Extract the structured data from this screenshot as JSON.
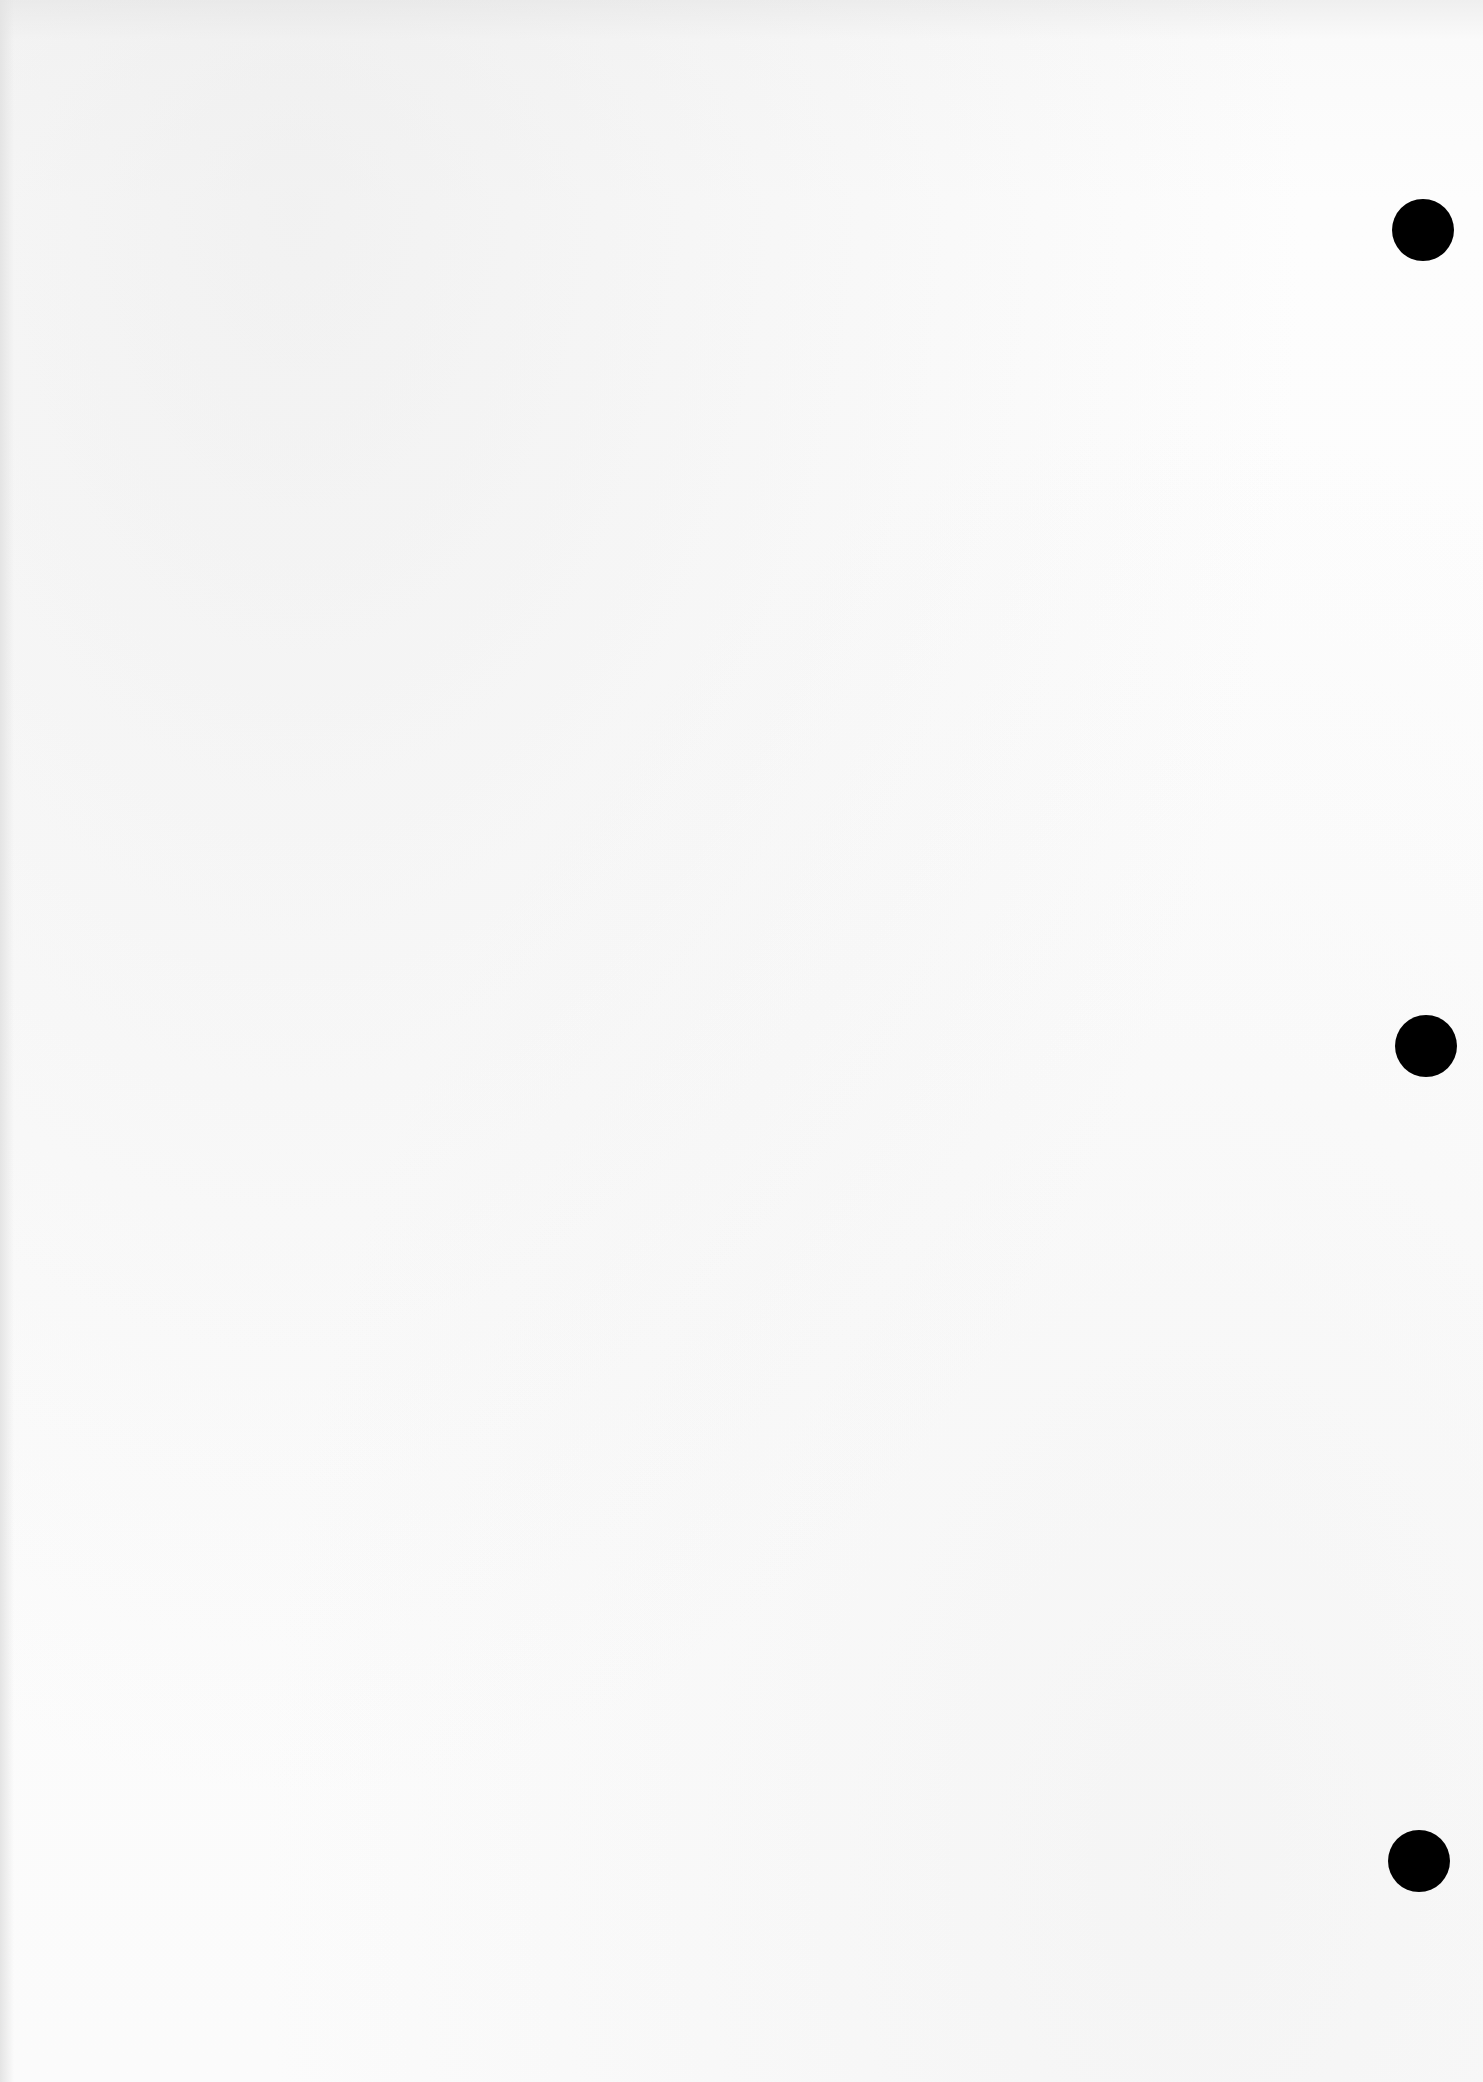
{
  "document": {
    "type": "blank scanned page",
    "text": "",
    "punch_holes": [
      {
        "cx": 1423,
        "cy": 230
      },
      {
        "cx": 1426,
        "cy": 1046
      },
      {
        "cx": 1419,
        "cy": 1861
      }
    ],
    "colors": {
      "paper": "#fbfbfb",
      "hole": "#000000"
    }
  }
}
